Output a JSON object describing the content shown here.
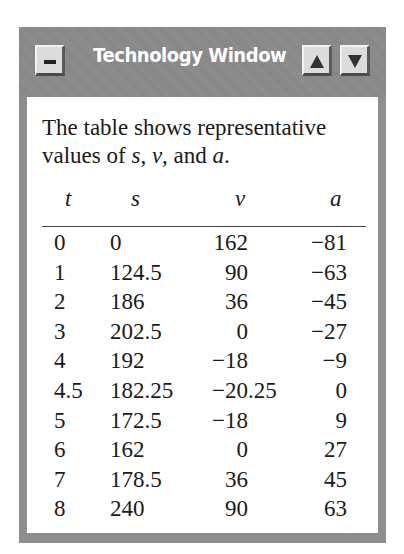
{
  "window": {
    "title": "Technology Window",
    "buttons": {
      "minimize": "minimize-button",
      "scroll_up": "scroll-up-button",
      "scroll_down": "scroll-down-button"
    },
    "colors": {
      "frame": "#8e8e8e",
      "title_text": "#ffffff",
      "button_face": "#dcdcdc",
      "content_bg": "#ffffff"
    }
  },
  "content": {
    "intro_parts": [
      "The table shows representative values of ",
      "s",
      ", ",
      "v",
      ", and ",
      "a",
      "."
    ],
    "table": {
      "headers": [
        "t",
        "s",
        "v",
        "a"
      ],
      "rows": [
        {
          "t": "0",
          "s": "0",
          "v_int": "162",
          "v_frac": "",
          "a": "−81"
        },
        {
          "t": "1",
          "s": "124.5",
          "v_int": "90",
          "v_frac": "",
          "a": "−63"
        },
        {
          "t": "2",
          "s": "186",
          "v_int": "36",
          "v_frac": "",
          "a": "−45"
        },
        {
          "t": "3",
          "s": "202.5",
          "v_int": "0",
          "v_frac": "",
          "a": "−27"
        },
        {
          "t": "4",
          "s": "192",
          "v_int": "−18",
          "v_frac": "",
          "a": "−9"
        },
        {
          "t": "4.5",
          "s": "182.25",
          "v_int": "−20",
          "v_frac": ".25",
          "a": "0"
        },
        {
          "t": "5",
          "s": "172.5",
          "v_int": "−18",
          "v_frac": "",
          "a": "9"
        },
        {
          "t": "6",
          "s": "162",
          "v_int": "0",
          "v_frac": "",
          "a": "27"
        },
        {
          "t": "7",
          "s": "178.5",
          "v_int": "36",
          "v_frac": "",
          "a": "45"
        },
        {
          "t": "8",
          "s": "240",
          "v_int": "90",
          "v_frac": "",
          "a": "63"
        }
      ]
    }
  }
}
